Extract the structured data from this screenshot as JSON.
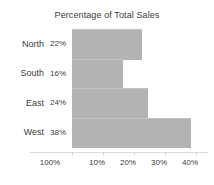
{
  "chart_data": {
    "type": "bar",
    "orientation": "horizontal",
    "title": "Percentage of Total Sales",
    "xlabel": "",
    "ylabel": "",
    "categories": [
      "North",
      "South",
      "East",
      "West"
    ],
    "values": [
      22,
      16,
      24,
      38
    ],
    "value_labels": [
      "22%",
      "16%",
      "24%",
      "38%"
    ],
    "xticks": [
      {
        "label": "100%",
        "value": 0,
        "x_px": 50
      },
      {
        "label": "10%",
        "value": 10,
        "x_px": 97
      },
      {
        "label": "20%",
        "value": 20,
        "x_px": 128
      },
      {
        "label": "30%",
        "value": 30,
        "x_px": 159
      },
      {
        "label": "40%",
        "value": 40,
        "x_px": 190
      }
    ],
    "xlim": [
      0,
      40
    ],
    "grid": false,
    "legend": false,
    "bar_color": "#b3b3b3",
    "text_color": "#3a3a3a",
    "background": "#ffffff"
  },
  "bars": [
    {
      "category": "North",
      "value_label": "22%",
      "width_px": 70
    },
    {
      "category": "South",
      "value_label": "16%",
      "width_px": 51
    },
    {
      "category": "East",
      "value_label": "24%",
      "width_px": 76
    },
    {
      "category": "West",
      "value_label": "38%",
      "width_px": 119
    }
  ]
}
